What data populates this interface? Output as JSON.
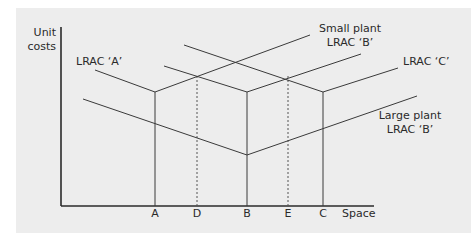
{
  "figure": {
    "axes": {
      "y_label_line1": "Unit",
      "y_label_line2": "costs",
      "x_label": "Space"
    },
    "x_ticks": [
      {
        "id": "A",
        "label": "A",
        "style": "solid"
      },
      {
        "id": "D",
        "label": "D",
        "style": "dashed"
      },
      {
        "id": "B",
        "label": "B",
        "style": "solid"
      },
      {
        "id": "E",
        "label": "E",
        "style": "dashed"
      },
      {
        "id": "C",
        "label": "C",
        "style": "solid"
      }
    ],
    "curves": [
      {
        "id": "lrac-a",
        "label": "LRAC ‘A’",
        "minimum_at": "A"
      },
      {
        "id": "small-plant-lrac-b",
        "label_line1": "Small plant",
        "label_line2": "LRAC ‘B’",
        "minimum_at": "B"
      },
      {
        "id": "lrac-c",
        "label": "LRAC ‘C’",
        "minimum_at": "C"
      },
      {
        "id": "large-plant-lrac-b",
        "label_line1": "Large plant",
        "label_line2": "LRAC ‘B’",
        "minimum_at": "B"
      }
    ],
    "colors": {
      "background": "#ededed",
      "line": "#3a3a3a"
    }
  }
}
